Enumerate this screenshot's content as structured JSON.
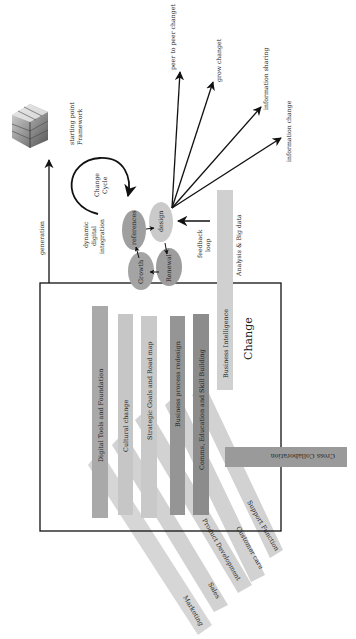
{
  "diagram": {
    "title": "Change",
    "colors": {
      "background": "#ffffff",
      "line": "#111111",
      "bar_dark": "#8a8a8a",
      "bar_mid": "#9a9a9a",
      "bar_light": "#c8c8c8",
      "bar_lighter": "#d4d4d4",
      "ellipse_dark": "#9c9c9c",
      "ellipse_light": "#c9c9c9"
    },
    "top": {
      "cube_label_line1": "starting point",
      "cube_label_line2": "Framework",
      "generation_label": "generation",
      "change_cycle_line1": "Change",
      "change_cycle_line2": "Cycle",
      "integration_line1": "dynamic",
      "integration_line2": "digital",
      "integration_line3": "integration",
      "feedback_line1": "feedback",
      "feedback_line2": "loop"
    },
    "cycle_nodes": [
      {
        "label": "references"
      },
      {
        "label": "design"
      },
      {
        "label": "Growth"
      },
      {
        "label": "Renewal"
      }
    ],
    "outputs": [
      {
        "label": "peer to peer changet"
      },
      {
        "label": "grow changet"
      },
      {
        "label": "information sharing"
      },
      {
        "label": "information change"
      }
    ],
    "analysis": {
      "outer_label": "Analysis & Big data",
      "bar_label": "Business Intelligence"
    },
    "pillars": [
      {
        "label": "Digital Tools and Foundation"
      },
      {
        "label": "Cultural change"
      },
      {
        "label": "Strategic Goals and Road map"
      },
      {
        "label": "Business process redesign"
      },
      {
        "label": "Comms, Education and Skill Building"
      }
    ],
    "functions": [
      {
        "label": "Marketing"
      },
      {
        "label": "Sales"
      },
      {
        "label": "Product Development"
      },
      {
        "label": "Customer care"
      },
      {
        "label": "Support Function"
      }
    ],
    "cross": {
      "label": "Cross Collaboration"
    }
  }
}
